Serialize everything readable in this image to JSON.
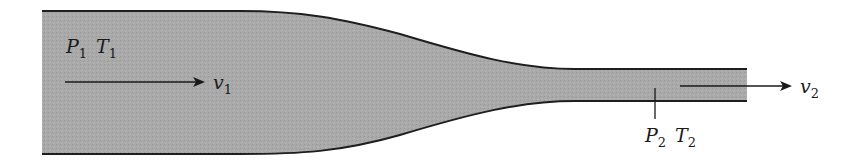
{
  "figure": {
    "colors": {
      "fluid_fill": "#a9a9a9",
      "wall_stroke": "#1e1e1e",
      "text": "#1a1a1a",
      "background": "#ffffff"
    },
    "inlet": {
      "pressure_symbol": "P",
      "pressure_sub": "1",
      "temperature_symbol": "T",
      "temperature_sub": "1",
      "velocity_symbol": "v",
      "velocity_sub": "1"
    },
    "outlet": {
      "pressure_symbol": "P",
      "pressure_sub": "2",
      "temperature_symbol": "T",
      "temperature_sub": "2",
      "velocity_symbol": "v",
      "velocity_sub": "2"
    }
  }
}
